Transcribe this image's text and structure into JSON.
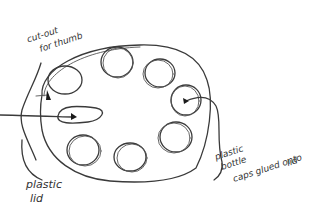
{
  "diagram": {
    "title": "",
    "labels": {
      "cutout_line1": "cut-out",
      "cutout_line2": "for thumb",
      "lid_line1": "plastic",
      "lid_line2": "lid",
      "caps_line1": "plastic",
      "caps_line2": "bottle",
      "caps_line3": "caps glued onto",
      "caps_line4": "lid"
    },
    "components": [
      {
        "name": "plastic lid",
        "shape": "oval"
      },
      {
        "name": "cut-out for thumb",
        "shape": "elongated oval"
      },
      {
        "name": "plastic bottle caps",
        "shape": "circle",
        "count": 7
      }
    ],
    "colors": {
      "ink": "#3a3a3a",
      "background": "#ffffff"
    }
  }
}
